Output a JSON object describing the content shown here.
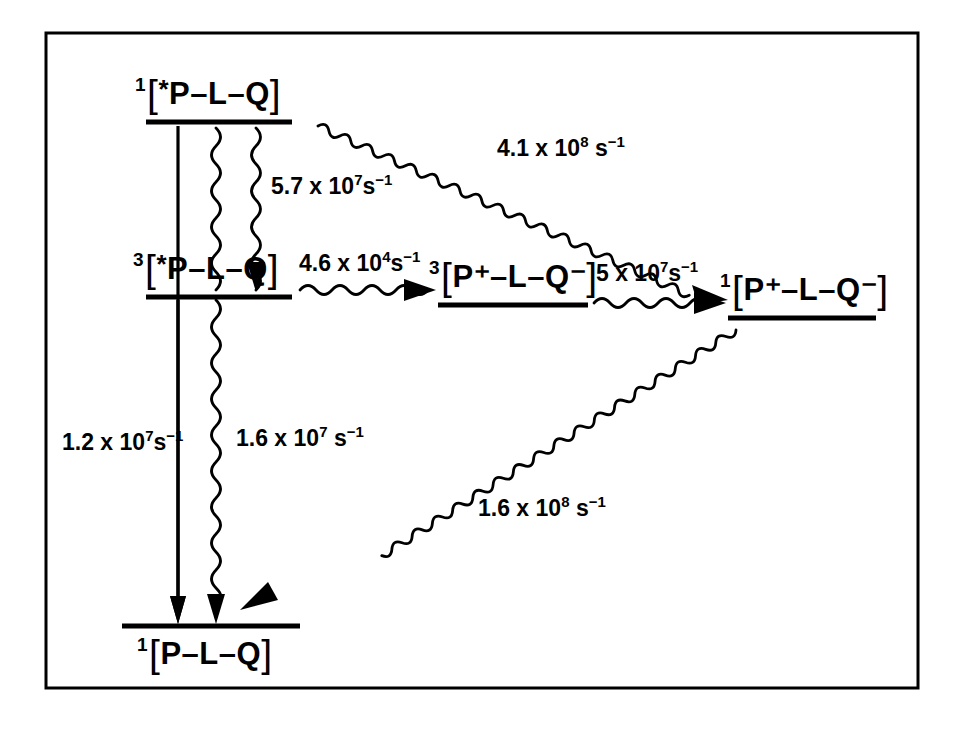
{
  "figure": {
    "type": "energy-level-kinetic-diagram",
    "border_color": "#000000",
    "ink_color": "#000000",
    "background_color": "#ffffff",
    "width": 964,
    "height": 735
  },
  "states": [
    {
      "id": "s1-excited-singlet",
      "multiplicity": "1",
      "open_bracket": "[",
      "star": "*",
      "formula": "P–L–Q",
      "close_bracket": "]",
      "label_position": "above-line",
      "full_text": "1[*P–L–Q]"
    },
    {
      "id": "t1-excited-triplet",
      "multiplicity": "3",
      "open_bracket": "[",
      "star": "*",
      "formula": "P–L–Q",
      "close_bracket": "]",
      "label_position": "above-line",
      "full_text": "3[*P–L–Q]"
    },
    {
      "id": "triplet-radical-pair",
      "multiplicity": "3",
      "open_bracket": "[",
      "star": "",
      "formula": "P⁺–L–Q⁻",
      "close_bracket": "]",
      "label_position": "above-line",
      "full_text": "3[P⁺–L–Q⁻]"
    },
    {
      "id": "singlet-radical-pair",
      "multiplicity": "1",
      "open_bracket": "[",
      "star": "",
      "formula": "P⁺–L–Q⁻",
      "close_bracket": "]",
      "label_position": "above-line",
      "full_text": "1[P⁺–L–Q⁻]"
    },
    {
      "id": "ground-state",
      "multiplicity": "1",
      "open_bracket": "[",
      "star": "",
      "formula": "P–L–Q",
      "close_bracket": "]",
      "label_position": "below-line",
      "full_text": "1[P–L–Q]"
    }
  ],
  "rates": [
    {
      "id": "rate-isc-s1-t1",
      "mantissa": "5.7 x 10",
      "exponent": "7",
      "unit": "s",
      "unit_exponent": "−1",
      "full_text": "5.7 x 10⁷ s⁻¹",
      "from": "s1-excited-singlet",
      "to": "t1-excited-triplet",
      "arrow_style": "wavy"
    },
    {
      "id": "rate-s1-to-singlet-rp",
      "mantissa": "4.1 x 10",
      "exponent": "8",
      "unit": "s",
      "unit_exponent": "−1",
      "full_text": "4.1 x 10⁸ s⁻¹",
      "from": "s1-excited-singlet",
      "to": "singlet-radical-pair",
      "arrow_style": "wavy"
    },
    {
      "id": "rate-t1-to-triplet-rp",
      "mantissa": "4.6 x 10",
      "exponent": "4",
      "unit": "s",
      "unit_exponent": "−1",
      "full_text": "4.6 x 10⁴ s⁻¹",
      "from": "t1-excited-triplet",
      "to": "triplet-radical-pair",
      "arrow_style": "wavy"
    },
    {
      "id": "rate-triplet-rp-to-singlet-rp",
      "mantissa": "5 x 10",
      "exponent": "7",
      "unit": "s",
      "unit_exponent": "−1",
      "full_text": "5 x 10⁷ s⁻¹",
      "from": "triplet-radical-pair",
      "to": "singlet-radical-pair",
      "arrow_style": "wavy"
    },
    {
      "id": "rate-t1-radiative-to-ground",
      "mantissa": "1.2 x 10",
      "exponent": "7",
      "unit": "s",
      "unit_exponent": "−1",
      "full_text": "1.2 x 10⁷ s⁻¹",
      "from": "t1-excited-triplet",
      "to": "ground-state",
      "arrow_style": "straight"
    },
    {
      "id": "rate-t1-nonradiative-to-ground",
      "mantissa": "1.6 x 10",
      "exponent": "7",
      "unit": "s",
      "unit_exponent": "−1",
      "full_text": "1.6 x 10⁷ s⁻¹",
      "from": "t1-excited-triplet",
      "to": "ground-state",
      "arrow_style": "wavy"
    },
    {
      "id": "rate-charge-recombination-to-ground",
      "mantissa": "1.6 x 10",
      "exponent": "8",
      "unit": "s",
      "unit_exponent": "−1",
      "full_text": "1.6 x 10⁸ s⁻¹",
      "from": "singlet-radical-pair",
      "to": "ground-state",
      "arrow_style": "wavy"
    }
  ]
}
